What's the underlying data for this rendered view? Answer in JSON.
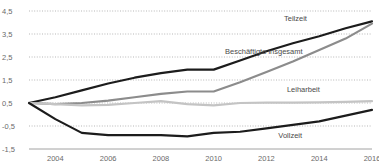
{
  "chart_data": {
    "type": "line",
    "title": "",
    "subtitle": "",
    "xlabel": "",
    "ylabel": "",
    "grid": true,
    "legend_position": "inline-right",
    "xlim": [
      2003,
      2016
    ],
    "ylim": [
      -1.5,
      4.5
    ],
    "y_ticks": [
      "4,5",
      "3,5",
      "2,5",
      "1,5",
      "0,5",
      "-0,5",
      "-1,5"
    ],
    "y_tick_values": [
      4.5,
      3.5,
      2.5,
      1.5,
      0.5,
      -0.5,
      -1.5
    ],
    "x_ticks": [
      "2004",
      "2006",
      "2008",
      "2010",
      "2012",
      "2014",
      "2016"
    ],
    "x_tick_values": [
      2004,
      2006,
      2008,
      2010,
      2012,
      2014,
      2016
    ],
    "x": [
      2003,
      2004,
      2005,
      2006,
      2007,
      2008,
      2009,
      2010,
      2011,
      2012,
      2013,
      2014,
      2015,
      2016
    ],
    "series": [
      {
        "name": "Teilzeit",
        "color": "#1c1c1c",
        "width": 2.2,
        "values": [
          0.5,
          0.75,
          1.05,
          1.35,
          1.6,
          1.8,
          1.95,
          1.95,
          2.35,
          2.75,
          3.1,
          3.4,
          3.75,
          4.05
        ]
      },
      {
        "name": "Beschäftigte insgesamt",
        "color": "#8c8c8c",
        "width": 2.2,
        "values": [
          0.5,
          0.45,
          0.5,
          0.6,
          0.75,
          0.9,
          1.0,
          1.0,
          1.4,
          1.85,
          2.3,
          2.8,
          3.3,
          3.95
        ]
      },
      {
        "name": "Leiharbeit",
        "color": "#c4c4c4",
        "width": 2.2,
        "values": [
          0.5,
          0.45,
          0.4,
          0.42,
          0.5,
          0.58,
          0.45,
          0.4,
          0.5,
          0.52,
          0.52,
          0.53,
          0.55,
          0.58
        ]
      },
      {
        "name": "Vollzeit",
        "color": "#1c1c1c",
        "width": 2.2,
        "values": [
          0.5,
          -0.2,
          -0.8,
          -0.9,
          -0.9,
          -0.9,
          -0.95,
          -0.8,
          -0.75,
          -0.6,
          -0.45,
          -0.3,
          -0.05,
          0.2
        ]
      }
    ],
    "annotations": [
      {
        "text": "Teilzeit",
        "x": 2013.1,
        "y": 4.05
      },
      {
        "text": "Beschäftigte insgesamt",
        "x": 2011.9,
        "y": 2.62
      },
      {
        "text": "Leiharbeit",
        "x": 2013.4,
        "y": 0.98
      },
      {
        "text": "Vollzeit",
        "x": 2012.9,
        "y": -1.02
      }
    ]
  }
}
